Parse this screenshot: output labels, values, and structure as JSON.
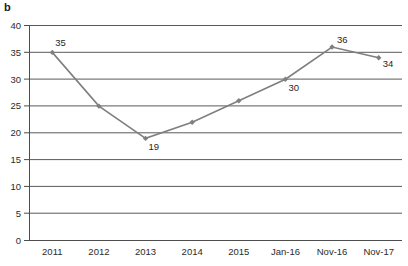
{
  "panel": {
    "label": "b"
  },
  "chart_data": {
    "type": "line",
    "title": "",
    "subtitle": "",
    "xlabel": "",
    "ylabel": "",
    "categories": [
      "2011",
      "2012",
      "2013",
      "2014",
      "2015",
      "Jan-16",
      "Nov-16",
      "Nov-17"
    ],
    "values": [
      35,
      25,
      19,
      22,
      26,
      30,
      36,
      34
    ],
    "point_labels": [
      "35",
      "",
      "19",
      "",
      "",
      "30",
      "36",
      "34"
    ],
    "ylim": [
      0,
      40
    ],
    "ytick_step": 5,
    "yticks": [
      "0",
      "5",
      "10",
      "15",
      "20",
      "25",
      "30",
      "35",
      "40"
    ],
    "grid": "horizontal",
    "legend": "none",
    "series": [
      {
        "name": "series-1",
        "values": [
          35,
          25,
          19,
          22,
          26,
          30,
          36,
          34
        ],
        "color": "#7f7f7f",
        "marker": "diamond"
      }
    ]
  },
  "colors": {
    "line": "#7f7f7f",
    "marker": "#7f7f7f",
    "grid": "#5a5a5a",
    "axis": "#4d4d4d",
    "text": "#1f1f1f"
  }
}
